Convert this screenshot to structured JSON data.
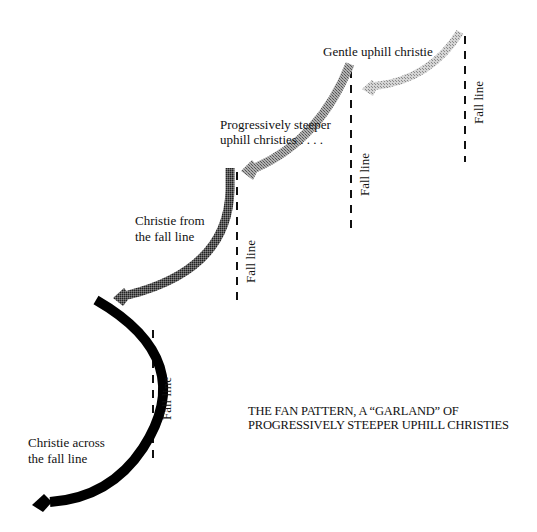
{
  "diagram": {
    "title_line1": "THE FAN PATTERN, A “GARLAND” OF",
    "title_line2": "PROGRESSIVELY STEEPER UPHILL CHRISTIES",
    "turns": [
      {
        "id": "gentle",
        "label": "Gentle uphill christie",
        "fall_line_label": "Fall line",
        "color": "#b8b8b8"
      },
      {
        "id": "steeper",
        "label_line1": "Progressively steeper",
        "label_line2": "uphill christies . . . .",
        "fall_line_label": "Fall line",
        "color": "#9a9a9a"
      },
      {
        "id": "from-fall-line",
        "label_line1": "Christie from",
        "label_line2": "the fall line",
        "fall_line_label": "Fall line",
        "color": "#555555"
      },
      {
        "id": "across-fall-line",
        "label_line1": "Christie across",
        "label_line2": "the fall line",
        "fall_line_label": "Fall line",
        "color": "#000000"
      }
    ]
  }
}
